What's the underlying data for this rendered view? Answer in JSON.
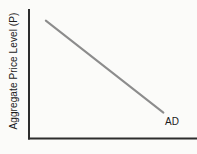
{
  "figure": {
    "background_color": "#fbfbf9",
    "text_color": "#1c1c1c"
  },
  "chart_data": {
    "type": "line",
    "title": "",
    "xlabel": "",
    "ylabel": "Aggregate Price Level (P)",
    "axes": {
      "color": "#2d2d2d",
      "stroke_width": 2,
      "x_axis_visible": true,
      "y_axis_visible": true,
      "ticks": false,
      "tick_labels": false,
      "grid": false
    },
    "series": [
      {
        "name": "AD",
        "color": "#8c8c8c",
        "stroke_width": 2,
        "points_rel": [
          {
            "x": 0.1,
            "y": 0.91
          },
          {
            "x": 0.8,
            "y": 0.2
          }
        ],
        "label_position": "below-right-of-line-end"
      }
    ],
    "legend": "none"
  }
}
